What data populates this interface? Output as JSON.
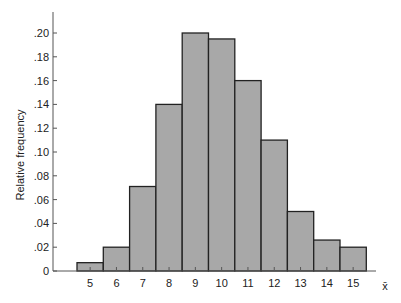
{
  "chart_data": {
    "type": "bar",
    "title": "",
    "xlabel": "x̄",
    "ylabel": "Relative frequency",
    "categories": [
      "5",
      "6",
      "7",
      "8",
      "9",
      "10",
      "11",
      "12",
      "13",
      "14",
      "15"
    ],
    "values": [
      0.007,
      0.02,
      0.071,
      0.14,
      0.2,
      0.195,
      0.16,
      0.11,
      0.05,
      0.026,
      0.02
    ],
    "yticks": [
      "0",
      ".02",
      ".04",
      ".06",
      ".08",
      ".10",
      ".12",
      ".14",
      ".16",
      ".18",
      ".20"
    ],
    "ylim": [
      0,
      0.22
    ],
    "grid": false,
    "legend": null,
    "bar_fill": "#a8a8a8",
    "bar_stroke": "#222222"
  }
}
